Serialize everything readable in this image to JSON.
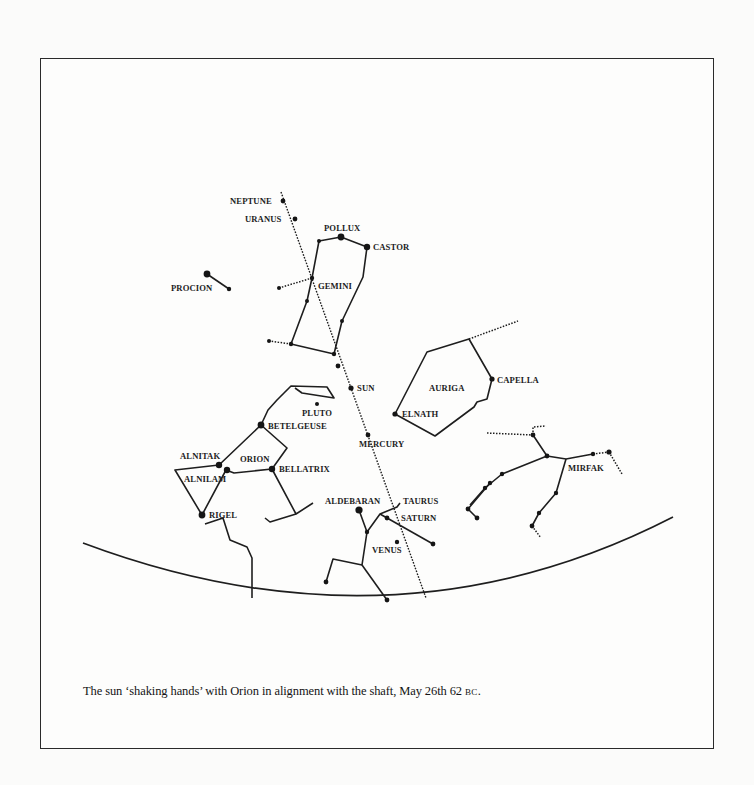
{
  "figure": {
    "caption_main": "The sun ‘shaking hands’ with Orion in alignment with the shaft, May 26th 62 ",
    "caption_era": "BC",
    "caption_end": "."
  },
  "labels": {
    "neptune": "NEPTUNE",
    "uranus": "URANUS",
    "pollux": "POLLUX",
    "castor": "CASTOR",
    "gemini": "GEMINI",
    "procion": "PROCION",
    "sun": "SUN",
    "pluto": "PLUTO",
    "betelgeuse": "BETELGEUSE",
    "orion": "ORION",
    "alnitak": "ALNITAK",
    "alnilam": "ALNILAM",
    "bellatrix": "BELLATRIX",
    "rigel": "RIGEL",
    "mercury": "MERCURY",
    "auriga": "AURIGA",
    "capella": "CAPELLA",
    "elnath": "ELNATH",
    "mirfak": "MIRFAK",
    "aldebaran": "ALDEBARAN",
    "taurus": "TAURUS",
    "saturn": "SATURN",
    "venus": "VENUS"
  },
  "colors": {
    "ink": "#1e1e1e",
    "paper": "#fdfdfc"
  }
}
